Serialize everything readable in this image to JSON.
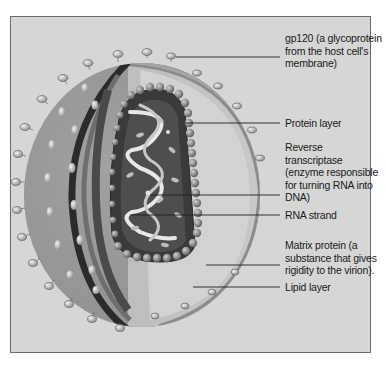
{
  "diagram": {
    "labels": [
      {
        "id": "gp120",
        "text": "gp120 (a glycoprotein from the host cell's membrane)",
        "lines": [
          "gp120 (a glycoprotein",
          "from the host cell's",
          "membrane)"
        ]
      },
      {
        "id": "protein-layer",
        "text": "Protein layer",
        "lines": [
          "Protein layer"
        ]
      },
      {
        "id": "reverse-transcriptase",
        "text": "Reverse transcriptase (enzyme responsible for turning RNA into DNA)",
        "lines": [
          "Reverse",
          "transcriptase",
          "(enzyme responsible",
          "for turning RNA into",
          "DNA)"
        ]
      },
      {
        "id": "rna-strand",
        "text": "RNA strand",
        "lines": [
          "RNA strand"
        ]
      },
      {
        "id": "matrix-protein",
        "text": "Matrix protein (a substance that gives rigidity to the virion).",
        "lines": [
          "Matrix protein (a",
          "substance that gives",
          "rigidity to the virion)."
        ]
      },
      {
        "id": "lipid-layer",
        "text": "Lipid layer",
        "lines": [
          "Lipid layer"
        ]
      }
    ],
    "colors": {
      "background": "#d6d6d6",
      "panel_border": "#6a6a6a",
      "leader_line": "#222222",
      "label_text": "#1a1a1a"
    }
  }
}
